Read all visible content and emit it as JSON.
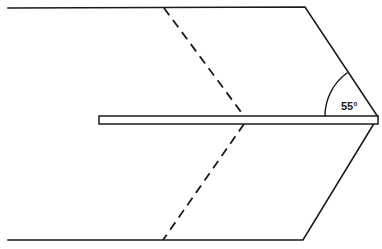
{
  "figure": {
    "name": "shear-plane-angle-diagram",
    "type": "technical-line-drawing",
    "background_color": "#ffffff",
    "stroke_color": "#1a1a1a",
    "canvas": {
      "width": 382,
      "height": 249
    }
  },
  "annotations": {
    "angle_label": {
      "text": "55°",
      "value": 55,
      "unit": "degrees",
      "color": "#1a1a1a",
      "x": 341,
      "y": 101
    }
  },
  "shapes": {
    "workpiece_outline": {
      "name": "workpiece-parallelogram",
      "description": "Large parallelogram body with vertical left edge and slanted right edges meeting at a point",
      "points": "8,8 305,7 378,117 303,240 8,240",
      "stroke_color": "#1a1a1a",
      "stroke_width": 1.6,
      "fill": "none"
    },
    "tool_bar": {
      "name": "tool-blade-bar",
      "description": "Thin horizontal bar entering from the left at mid height",
      "x": 99,
      "y": 116,
      "width": 279,
      "height": 8,
      "stroke_color": "#1a1a1a",
      "stroke_width": 1.5,
      "fill": "#ffffff"
    },
    "shear_plane_upper": {
      "name": "shear-plane-dashed-upper",
      "description": "Dashed line from top edge down to the bar",
      "x1": 164,
      "y1": 8,
      "x2": 244,
      "y2": 116,
      "stroke_color": "#1a1a1a",
      "stroke_width": 1.8,
      "dash": "9 6"
    },
    "shear_plane_lower": {
      "name": "shear-plane-dashed-lower",
      "description": "Dashed line from the bar down to the bottom edge",
      "x1": 244,
      "y1": 124,
      "x2": 163,
      "y2": 240,
      "stroke_color": "#1a1a1a",
      "stroke_width": 1.8,
      "dash": "9 6"
    },
    "angle_arc": {
      "name": "angle-arc",
      "description": "Arc spanning the 55 degree angle at the right vertex between the horizontal bar and the upper slanted edge",
      "path": "M 325,116 A 53,53 0 0 1 347,73",
      "stroke_color": "#1a1a1a",
      "stroke_width": 1.4,
      "fill": "none"
    }
  }
}
